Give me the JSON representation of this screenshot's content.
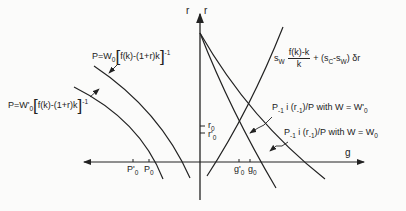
{
  "diagram": {
    "axes": {
      "vertical_left_label": "r",
      "vertical_right_label": "r",
      "horizontal_right_label": "g"
    },
    "ticks": {
      "r0": "r",
      "r0_sub": "0",
      "r0p": "r'",
      "r0p_sub": "0",
      "g0p": "g'",
      "g0p_sub": "0",
      "g0": "g",
      "g0_sub": "0",
      "P0p": "P'",
      "P0p_sub": "0",
      "P0": "P",
      "P0_sub": "0"
    },
    "curves": {
      "upper_left": {
        "prefix": "P=W",
        "sub": "0",
        "body": "f(k)-(1+r)k",
        "exp": "-1"
      },
      "lower_left": {
        "prefix": "P=W'",
        "sub": "0",
        "body": "f(k)-(1+r)k",
        "exp": "-1"
      },
      "savings": {
        "s": "s",
        "w_sub": "W",
        "num": "f(k)-k",
        "den": "k",
        "rest_a": "+ (s",
        "c_sub": "C",
        "rest_b": "-s",
        "w_sub2": "W",
        "rest_c": ") δr"
      },
      "investment_w0p": {
        "p": "P",
        "p_sub": "-1",
        "i": " i (r",
        "r_sub": "-1",
        "tail": ")/P  with  W = W'",
        "w_sub": "0"
      },
      "investment_w0": {
        "p": "P",
        "p_sub": "-1",
        "i": " i (r",
        "r_sub": "-1",
        "tail": ")/P  with  W = W",
        "w_sub": "0"
      }
    }
  }
}
